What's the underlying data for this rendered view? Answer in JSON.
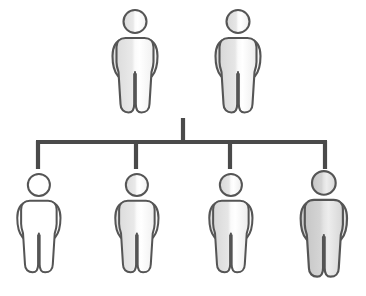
{
  "diagram": {
    "type": "organizational-hierarchy",
    "canvas": {
      "width": 366,
      "height": 296,
      "background": "#ffffff"
    },
    "style": {
      "figure_stroke": "#555555",
      "figure_stroke_width": 2.1,
      "connector_stroke": "#4a4a4a",
      "connector_stroke_width": 4.2,
      "fill_light": "#f2f2f2",
      "fill_mid": "#e8e8e8",
      "fill_dark": "#d8d8d8",
      "fill_white": "#ffffff",
      "highlight_white": "#ffffff"
    },
    "levels": [
      {
        "name": "parents",
        "label": "Parent Generation",
        "row_index": 0,
        "figure_count": 2,
        "figures": [
          {
            "id": "parent-1",
            "label": "Parent 1",
            "x": 135,
            "y": 8,
            "scale": 1.0,
            "fill": "#f0f0f0",
            "shade": "light"
          },
          {
            "id": "parent-2",
            "label": "Parent 2",
            "x": 238,
            "y": 8,
            "scale": 1.0,
            "fill": "#eeeeee",
            "shade": "light"
          }
        ]
      },
      {
        "name": "children",
        "label": "Child Generation",
        "row_index": 1,
        "figure_count": 4,
        "figures": [
          {
            "id": "child-1",
            "label": "Child 1",
            "x": 40,
            "y": 172,
            "scale": 0.96,
            "fill": "#ffffff",
            "shade": "white"
          },
          {
            "id": "child-2",
            "label": "Child 2",
            "x": 137,
            "y": 172,
            "scale": 0.96,
            "fill": "#f0f0f0",
            "shade": "light"
          },
          {
            "id": "child-3",
            "label": "Child 3",
            "x": 230,
            "y": 172,
            "scale": 0.96,
            "fill": "#ededed",
            "shade": "light"
          },
          {
            "id": "child-4",
            "label": "Child 4",
            "x": 324,
            "y": 170,
            "scale": 1.03,
            "fill": "#dcdcdc",
            "shade": "dark"
          }
        ]
      }
    ],
    "connectors": {
      "label": "Hierarchy Connector Bracket",
      "stem": {
        "x": 183,
        "y_top": 118,
        "y_bottom": 142
      },
      "bar": {
        "y": 142,
        "x_left": 38,
        "x_right": 325
      },
      "drops": [
        {
          "id": "drop-1",
          "x": 38,
          "y_top": 142,
          "y_bottom": 168
        },
        {
          "id": "drop-2",
          "x": 136,
          "y_top": 142,
          "y_bottom": 168
        },
        {
          "id": "drop-3",
          "x": 230,
          "y_top": 142,
          "y_bottom": 168
        },
        {
          "id": "drop-4",
          "x": 325,
          "y_top": 142,
          "y_bottom": 168
        }
      ]
    }
  }
}
